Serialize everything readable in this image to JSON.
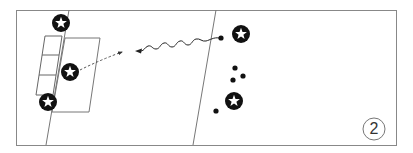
{
  "diagram": {
    "type": "soccer-drill",
    "step_number": "2",
    "colors": {
      "line": "#777777",
      "frame": "#888888",
      "player_fill": "#111111",
      "star_fill": "#ffffff",
      "ball": "#111111"
    },
    "players": [
      {
        "id": "p1",
        "icon": "star-player-icon",
        "x": 61,
        "y": 23
      },
      {
        "id": "p2",
        "icon": "star-player-icon",
        "x": 70,
        "y": 72
      },
      {
        "id": "p3",
        "icon": "star-player-icon",
        "x": 48,
        "y": 102
      },
      {
        "id": "p4",
        "icon": "star-player-icon",
        "x": 241,
        "y": 34
      },
      {
        "id": "p5",
        "icon": "star-player-icon",
        "x": 234,
        "y": 101
      }
    ],
    "balls": [
      {
        "id": "b1",
        "x": 221,
        "y": 38
      },
      {
        "id": "b2",
        "x": 235,
        "y": 68
      },
      {
        "id": "b3",
        "x": 243,
        "y": 76
      },
      {
        "id": "b4",
        "x": 233,
        "y": 80
      },
      {
        "id": "b5",
        "x": 216,
        "y": 111
      }
    ],
    "paths": [
      {
        "id": "dribble",
        "style": "wavy",
        "from": [
          221,
          38
        ],
        "to": [
          137,
          51
        ],
        "arrow": true
      },
      {
        "id": "pass",
        "style": "dashed",
        "from": [
          80,
          70
        ],
        "to": [
          122,
          52
        ],
        "arrow": true
      }
    ]
  }
}
